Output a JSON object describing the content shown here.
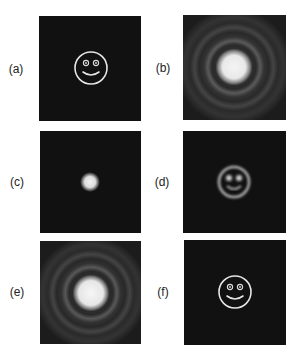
{
  "figure": {
    "background": "#ffffff",
    "panel_background": "#111111",
    "panels": [
      {
        "id": "a",
        "label": "(a)",
        "label_pos": [
          16,
          69
        ],
        "box": [
          39,
          16,
          102,
          105
        ],
        "content": "smiley-face-object",
        "description": "Original object: white line-drawn smiley face on black"
      },
      {
        "id": "b",
        "label": "(b)",
        "label_pos": [
          163,
          68
        ],
        "box": [
          183,
          15,
          103,
          105
        ],
        "content": "diffraction-pattern",
        "description": "Far-field diffraction pattern: bright central disk with faint concentric rings"
      },
      {
        "id": "c",
        "label": "(c)",
        "label_pos": [
          17,
          182
        ],
        "box": [
          40,
          131,
          101,
          102
        ],
        "content": "point-spread-spot",
        "description": "Small bright soft spot on black"
      },
      {
        "id": "d",
        "label": "(d)",
        "label_pos": [
          162,
          182
        ],
        "box": [
          183,
          131,
          103,
          102
        ],
        "content": "blurred-smiley",
        "description": "Blurred reconstruction of the smiley face"
      },
      {
        "id": "e",
        "label": "(e)",
        "label_pos": [
          17,
          292
        ],
        "box": [
          40,
          241,
          101,
          103
        ],
        "content": "diffraction-pattern",
        "description": "Diffraction pattern: bright central disk with faint concentric rings"
      },
      {
        "id": "f",
        "label": "(f)",
        "label_pos": [
          163,
          292
        ],
        "box": [
          184,
          240,
          102,
          105
        ],
        "content": "smiley-face-object",
        "description": "Recovered smiley face: white line drawing on black"
      }
    ]
  }
}
